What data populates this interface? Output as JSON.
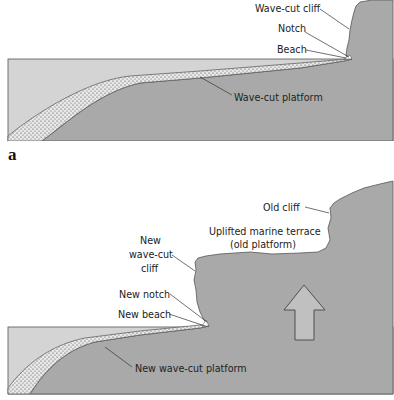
{
  "figure": {
    "panels": [
      {
        "id": "a",
        "letter": "a",
        "labels": {
          "wave_cut_cliff": "Wave-cut cliff",
          "notch": "Notch",
          "beach": "Beach",
          "wave_cut_platform": "Wave-cut platform"
        }
      },
      {
        "id": "b",
        "letter": "",
        "labels": {
          "old_cliff": "Old cliff",
          "terrace_line1": "Uplifted marine terrace",
          "terrace_line2": "(old platform)",
          "new_cliff_line1": "New",
          "new_cliff_line2": "wave-cut",
          "new_cliff_line3": "cliff",
          "new_notch": "New notch",
          "new_beach": "New beach",
          "new_platform": "New wave-cut platform"
        },
        "arrow": "uplift-arrow"
      }
    ],
    "colors": {
      "sea": "#d4d4d4",
      "land": "#a9a9a9",
      "sediment": "#e6e6e6",
      "outline": "#555555",
      "leader": "#333333"
    }
  }
}
